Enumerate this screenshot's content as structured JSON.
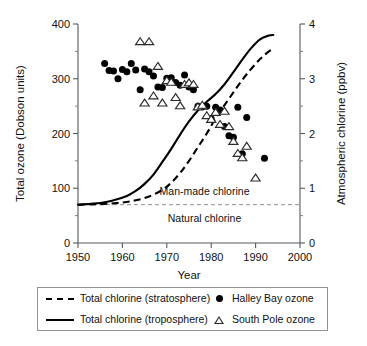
{
  "chart_data": {
    "type": "scatter",
    "title": "",
    "xlabel": "Year",
    "ylabel": "Total ozone (Dobson units)",
    "ylabel_right": "Atmospheric chlorine (ppbv)",
    "xlim": [
      1950,
      2000
    ],
    "ylim": [
      0,
      400
    ],
    "ylim_right": [
      0,
      4
    ],
    "xticks": [
      1950,
      1960,
      1970,
      1980,
      1990,
      2000
    ],
    "xticklabels": [
      "1950",
      "1960",
      "1970",
      "1980",
      "1990",
      "2000"
    ],
    "yticks": [
      0,
      100,
      200,
      300,
      400
    ],
    "yticklabels": [
      "0",
      "100",
      "200",
      "300",
      "400"
    ],
    "yticks_minor": [
      50,
      150,
      250,
      350
    ],
    "yticks_right": [
      0,
      1,
      2,
      3,
      4
    ],
    "yticklabels_right": [
      "0",
      "1",
      "2",
      "3",
      "4"
    ],
    "yticks_right_minor": [
      0.5,
      1.5,
      2.5,
      3.5
    ],
    "grid": false,
    "legend_position": "below-axes",
    "annotations": [
      {
        "text": "Man-made chlorine",
        "x": 1978.5,
        "y_ppbv": 0.95
      },
      {
        "text": "Natural chlorine",
        "x": 1978.5,
        "y_ppbv": 0.45
      }
    ],
    "reference_lines": [
      {
        "name": "natural-chlorine-baseline",
        "style": "dashed",
        "y_ppbv": 0.7,
        "color": "#8d9297"
      }
    ],
    "series": [
      {
        "name": "Total chlorine (stratosphere)",
        "type": "line",
        "style": "dashed",
        "axis": "right",
        "unit": "ppbv",
        "points": [
          [
            1950,
            0.7
          ],
          [
            1955,
            0.71
          ],
          [
            1960,
            0.74
          ],
          [
            1963,
            0.78
          ],
          [
            1966,
            0.85
          ],
          [
            1969,
            0.97
          ],
          [
            1971,
            1.1
          ],
          [
            1973,
            1.28
          ],
          [
            1975,
            1.5
          ],
          [
            1977,
            1.75
          ],
          [
            1979,
            2.0
          ],
          [
            1981,
            2.28
          ],
          [
            1983,
            2.52
          ],
          [
            1985,
            2.75
          ],
          [
            1987,
            2.98
          ],
          [
            1989,
            3.18
          ],
          [
            1991,
            3.36
          ],
          [
            1993,
            3.5
          ],
          [
            1994,
            3.55
          ]
        ]
      },
      {
        "name": "Total chlorine (troposphere)",
        "type": "line",
        "style": "solid",
        "axis": "right",
        "unit": "ppbv",
        "points": [
          [
            1950,
            0.7
          ],
          [
            1955,
            0.73
          ],
          [
            1958,
            0.78
          ],
          [
            1961,
            0.86
          ],
          [
            1963,
            0.95
          ],
          [
            1965,
            1.08
          ],
          [
            1967,
            1.25
          ],
          [
            1969,
            1.48
          ],
          [
            1971,
            1.72
          ],
          [
            1973,
            1.98
          ],
          [
            1975,
            2.22
          ],
          [
            1977,
            2.42
          ],
          [
            1979,
            2.58
          ],
          [
            1981,
            2.72
          ],
          [
            1983,
            2.9
          ],
          [
            1985,
            3.12
          ],
          [
            1987,
            3.35
          ],
          [
            1989,
            3.56
          ],
          [
            1991,
            3.72
          ],
          [
            1993,
            3.79
          ],
          [
            1994,
            3.8
          ]
        ]
      },
      {
        "name": "Halley Bay ozone",
        "type": "scatter",
        "marker": "filled-circle",
        "axis": "left",
        "unit": "Dobson units",
        "points": [
          [
            1956,
            328
          ],
          [
            1957,
            315
          ],
          [
            1958,
            314
          ],
          [
            1959,
            300
          ],
          [
            1960,
            317
          ],
          [
            1961,
            313
          ],
          [
            1962,
            328
          ],
          [
            1963,
            316
          ],
          [
            1964,
            280
          ],
          [
            1965,
            318
          ],
          [
            1966,
            313
          ],
          [
            1967,
            305
          ],
          [
            1968,
            285
          ],
          [
            1969,
            284
          ],
          [
            1970,
            301
          ],
          [
            1971,
            302
          ],
          [
            1972,
            293
          ],
          [
            1973,
            288
          ],
          [
            1974,
            307
          ],
          [
            1975,
            285
          ],
          [
            1976,
            280
          ],
          [
            1977,
            250
          ],
          [
            1978,
            249
          ],
          [
            1979,
            250
          ],
          [
            1980,
            227
          ],
          [
            1981,
            248
          ],
          [
            1982,
            243
          ],
          [
            1983,
            213
          ],
          [
            1984,
            196
          ],
          [
            1985,
            193
          ],
          [
            1986,
            248
          ],
          [
            1987,
            163
          ],
          [
            1988,
            229
          ],
          [
            1992,
            155
          ]
        ]
      },
      {
        "name": "South Pole ozone",
        "type": "scatter",
        "marker": "open-triangle",
        "axis": "left",
        "unit": "Dobson units",
        "points": [
          [
            1964,
            367
          ],
          [
            1966,
            367
          ],
          [
            1965,
            255
          ],
          [
            1967,
            268
          ],
          [
            1968,
            322
          ],
          [
            1969,
            255
          ],
          [
            1970,
            296
          ],
          [
            1971,
            293
          ],
          [
            1972,
            265
          ],
          [
            1973,
            250
          ],
          [
            1974,
            289
          ],
          [
            1975,
            292
          ],
          [
            1976,
            289
          ],
          [
            1977,
            248
          ],
          [
            1978,
            251
          ],
          [
            1979,
            232
          ],
          [
            1980,
            225
          ],
          [
            1981,
            238
          ],
          [
            1982,
            216
          ],
          [
            1983,
            240
          ],
          [
            1984,
            212
          ],
          [
            1985,
            185
          ],
          [
            1986,
            163
          ],
          [
            1987,
            155
          ],
          [
            1988,
            176
          ],
          [
            1990,
            118
          ]
        ]
      }
    ]
  },
  "legend": {
    "entries": [
      {
        "label": "Total chlorine (stratosphere)",
        "marker": "dashed-line"
      },
      {
        "label": "Halley Bay ozone",
        "marker": "filled-circle"
      },
      {
        "label": "Total chlorine (troposphere)",
        "marker": "solid-line"
      },
      {
        "label": "South Pole ozone",
        "marker": "open-triangle"
      }
    ]
  }
}
